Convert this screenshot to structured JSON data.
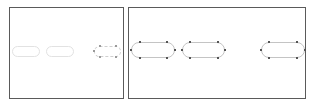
{
  "diagram": {
    "colors": {
      "frame_border": "#5a5a5a",
      "pill_faint": "#e2e2e2",
      "pill_outline": "#c4c4c4",
      "handle": "#555555",
      "background": "#ffffff"
    },
    "frames": [
      {
        "id": "left-frame",
        "x": 9,
        "y": 7,
        "width": 115,
        "height": 92,
        "shapes": [
          {
            "type": "rounded-rect",
            "style": "faint",
            "x": 12,
            "y": 46,
            "width": 28,
            "height": 11
          },
          {
            "type": "rounded-rect",
            "style": "faint",
            "x": 46,
            "y": 46,
            "width": 28,
            "height": 11
          },
          {
            "type": "rounded-rect",
            "style": "selected-dashed",
            "x": 94,
            "y": 46,
            "width": 27,
            "height": 11
          }
        ]
      },
      {
        "id": "right-frame",
        "x": 128,
        "y": 7,
        "width": 178,
        "height": 92,
        "shapes": [
          {
            "type": "rounded-rect",
            "style": "selected",
            "x": 131,
            "y": 42,
            "width": 44,
            "height": 16
          },
          {
            "type": "rounded-rect",
            "style": "selected",
            "x": 182,
            "y": 42,
            "width": 43,
            "height": 16
          },
          {
            "type": "rounded-rect",
            "style": "selected",
            "x": 261,
            "y": 42,
            "width": 44,
            "height": 16
          }
        ]
      }
    ]
  }
}
